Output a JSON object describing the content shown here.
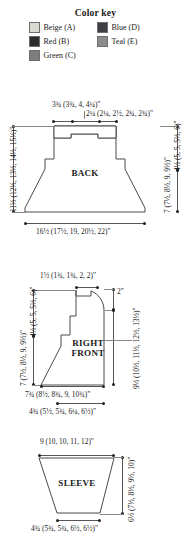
{
  "color_key": {
    "title": "Color key",
    "items": [
      {
        "label": "Beige (A)",
        "color": "#d9d9cf"
      },
      {
        "label": "Blue (D)",
        "color": "#3f3f44"
      },
      {
        "label": "Red (B)",
        "color": "#2b2b2b"
      },
      {
        "label": "Teal (E)",
        "color": "#8c8c8c"
      },
      {
        "label": "Green (C)",
        "color": "#7d7d7d"
      }
    ]
  },
  "schematics": [
    {
      "name": "back",
      "title": "BACK",
      "measurements": {
        "shoulder_top": "3¾ (3¾, 4, 4¼)\"",
        "neck_top": "2¼ (2¼, 2½, 2¾, 2¾)\"",
        "left_total_height": "11½ (12½, 13½, 14½, 15½)\"",
        "right_upper": "4½ (5, 5, 5½, 6)\"",
        "right_lower": "7 (7½, 8½, 9, 9½)\"",
        "bottom_width": "16½ (17½, 19, 20½, 22)\""
      }
    },
    {
      "name": "right_front",
      "title": "RIGHT FRONT",
      "measurements": {
        "shoulder_top": "1½ (1¾, 1¾, 2, 2)\"",
        "neck_depth": "2\"",
        "left_upper": "4½ (5, 5, 5½, 6)\"",
        "left_lower": "7 (7½, 8½, 9, 9½)\"",
        "right_total_height": "9½ (10½, 11½, 12½, 13½)\"",
        "bottom_width": "7¾ (8½, 8¾, 9, 10¾)\"",
        "inner_width": "4¾ (5½, 5¾, 6¼, 6½)\""
      }
    },
    {
      "name": "sleeve",
      "title": "SLEEVE",
      "measurements": {
        "top_width": "9 (10, 10, 11, 12)\"",
        "right_height": "6½ (7½, 8½, 9½, 10)\"",
        "bottom_width": "4¾ (5¾, 5¾, 6½, 6½)\""
      }
    }
  ]
}
